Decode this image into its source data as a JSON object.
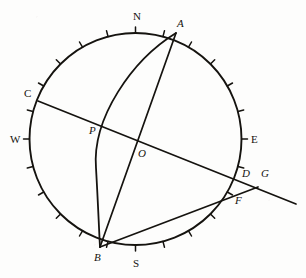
{
  "figure": {
    "kind": "stereographic-sphere-diagram",
    "background_color": "#fdfdfc",
    "stroke_color": "#15130f",
    "canvas": {
      "width": 306,
      "height": 278
    }
  },
  "circle": {
    "name": "primitive-circle",
    "cx": 135.5,
    "cy": 139,
    "r": 106,
    "stroke_width": 1.9,
    "tick_count": 24,
    "tick_step_degrees": 15,
    "tick_length": 6
  },
  "points": [
    {
      "id": "N",
      "label": "N",
      "italic": false,
      "px": 135.5,
      "py": 33,
      "lx": 134,
      "ly": 12
    },
    {
      "id": "S",
      "label": "S",
      "italic": false,
      "px": 135.5,
      "py": 245,
      "lx": 134,
      "ly": 259
    },
    {
      "id": "E",
      "label": "E",
      "italic": false,
      "px": 241.5,
      "py": 139,
      "lx": 251,
      "ly": 134
    },
    {
      "id": "W",
      "label": "W",
      "italic": false,
      "px": 29.5,
      "py": 139,
      "lx": 11,
      "ly": 134
    },
    {
      "id": "A",
      "label": "A",
      "italic": true,
      "px": 176,
      "py": 33,
      "lx": 177,
      "ly": 19
    },
    {
      "id": "B",
      "label": "B",
      "italic": true,
      "px": 100,
      "py": 247,
      "lx": 95,
      "ly": 253
    },
    {
      "id": "C",
      "label": "C",
      "italic": false,
      "px": 38,
      "py": 101,
      "lx": 25,
      "ly": 89
    },
    {
      "id": "D",
      "label": "D",
      "italic": true,
      "px": 241,
      "py": 176,
      "lx": 243,
      "ly": 169
    },
    {
      "id": "F",
      "label": "F",
      "italic": true,
      "px": 232,
      "py": 197,
      "lx": 235,
      "ly": 196
    },
    {
      "id": "G",
      "label": "G",
      "italic": true,
      "px": 259,
      "py": 183,
      "lx": 261,
      "ly": 169
    },
    {
      "id": "O",
      "label": "O",
      "italic": true,
      "px": 143,
      "py": 146,
      "lx": 139,
      "ly": 149
    },
    {
      "id": "P",
      "label": "P",
      "italic": true,
      "px": 97,
      "py": 129,
      "lx": 90,
      "ly": 127
    }
  ],
  "lines": [
    {
      "name": "chord-c-g",
      "from": "C",
      "to": "G",
      "x1": 38,
      "y1": 101,
      "x2": 296,
      "y2": 204,
      "stroke_width": 1.7
    },
    {
      "name": "chord-a-b",
      "from": "A",
      "to": "B",
      "x1": 176,
      "y1": 33,
      "x2": 100,
      "y2": 247,
      "stroke_width": 1.7
    },
    {
      "name": "chord-b-f",
      "from": "B",
      "to": "F",
      "x1": 100,
      "y1": 247,
      "x2": 258,
      "y2": 187,
      "stroke_width": 1.7
    }
  ],
  "arcs": [
    {
      "name": "great-circle-arc-a-p-b",
      "from": "A",
      "through": "P",
      "to": "B",
      "path": "M 176 33 C 130 62, 92 116, 96 166 C 98 200, 99 228, 100 247",
      "stroke_width": 1.8
    }
  ],
  "cardinal_labels": [
    "N",
    "S",
    "E",
    "W"
  ],
  "point_labels": [
    "A",
    "B",
    "C",
    "D",
    "F",
    "G",
    "O",
    "P"
  ]
}
